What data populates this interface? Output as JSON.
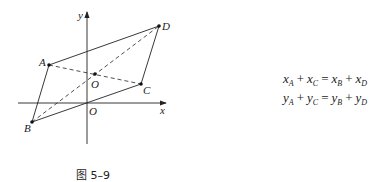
{
  "figure": {
    "caption": "图 5–9",
    "axes": {
      "x_label": "x",
      "y_label": "y",
      "origin_label": "O"
    },
    "points": {
      "A": {
        "label": "A",
        "px": [
          49,
          65
        ]
      },
      "B": {
        "label": "B",
        "px": [
          32,
          122
        ]
      },
      "C": {
        "label": "C",
        "px": [
          141,
          84
        ]
      },
      "D": {
        "label": "D",
        "px": [
          159,
          26
        ]
      },
      "center": {
        "label": "O",
        "px": [
          95,
          74
        ]
      }
    },
    "solid_edges": [
      "AD",
      "DC",
      "CB",
      "BA"
    ],
    "dashed_diagonals": [
      "AC",
      "BD"
    ]
  },
  "formulas": [
    {
      "terms": [
        [
          "x",
          "A"
        ],
        [
          "x",
          "C"
        ],
        [
          "x",
          "B"
        ],
        [
          "x",
          "D"
        ]
      ],
      "ops": [
        "+",
        "=",
        "+"
      ]
    },
    {
      "terms": [
        [
          "y",
          "A"
        ],
        [
          "y",
          "C"
        ],
        [
          "y",
          "B"
        ],
        [
          "y",
          "D"
        ]
      ],
      "ops": [
        "+",
        "=",
        "+"
      ]
    }
  ]
}
